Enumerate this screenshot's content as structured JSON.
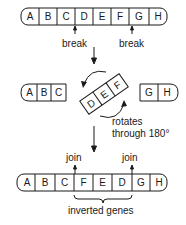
{
  "diagram": {
    "original_chromosome": {
      "genes": [
        "A",
        "B",
        "C",
        "D",
        "E",
        "F",
        "G",
        "H"
      ],
      "break_labels": [
        "break",
        "break"
      ]
    },
    "middle": {
      "left_fragment": [
        "A",
        "B",
        "C"
      ],
      "rotating_fragment": [
        "D",
        "E",
        "F"
      ],
      "right_fragment": [
        "G",
        "H"
      ],
      "rotation_label_line1": "rotates",
      "rotation_label_line2": "through 180°"
    },
    "result_chromosome": {
      "genes": [
        "A",
        "B",
        "C",
        "F",
        "E",
        "D",
        "G",
        "H"
      ],
      "join_labels": [
        "join",
        "join"
      ],
      "bracket_label": "inverted genes"
    },
    "colors": {
      "stroke": "#1a1a1a",
      "background": "#ffffff"
    }
  }
}
